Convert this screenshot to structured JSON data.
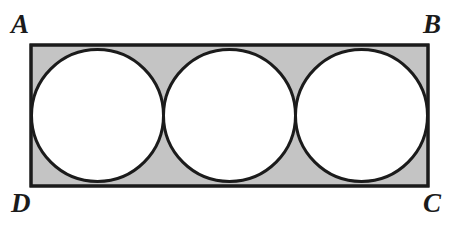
{
  "figure": {
    "kind": "geometry-diagram",
    "background_color": "#ffffff",
    "shaded_fill": "#c4c4c4",
    "circle_fill": "#ffffff",
    "stroke_color": "#1b1b1b",
    "rectangle": {
      "name": "ABCD",
      "x": 31,
      "y": 45,
      "width": 397,
      "height": 141,
      "stroke_width": 3
    },
    "circles": [
      {
        "cx": 97.5,
        "cy": 115.5,
        "r": 66,
        "stroke_width": 3
      },
      {
        "cx": 229.5,
        "cy": 115.5,
        "r": 66,
        "stroke_width": 3
      },
      {
        "cx": 361.5,
        "cy": 115.5,
        "r": 66,
        "stroke_width": 3
      }
    ],
    "tangent_points_x": [
      163.5,
      295.5
    ],
    "labels": {
      "a": "A",
      "b": "B",
      "c": "C",
      "d": "D"
    }
  },
  "chart_data": {
    "type": "diagram",
    "title": "",
    "shapes": [
      {
        "shape": "rectangle",
        "label": "ABCD",
        "vertices": [
          {
            "name": "A",
            "position": "top-left"
          },
          {
            "name": "B",
            "position": "top-right"
          },
          {
            "name": "C",
            "position": "bottom-right"
          },
          {
            "name": "D",
            "position": "bottom-left"
          }
        ],
        "width_units": 3,
        "height_units": 1,
        "fill": "#c4c4c4"
      },
      {
        "shape": "circle",
        "count": 3,
        "radius_units": 0.5,
        "fill": "#ffffff",
        "arrangement": "three congruent circles in a row, each tangent to the next and to the top and bottom sides of the rectangle"
      }
    ]
  }
}
